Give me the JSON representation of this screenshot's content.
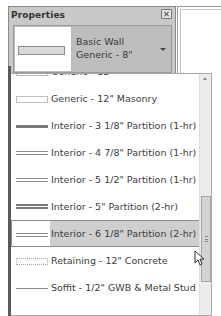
{
  "panel": {
    "title": "Properties",
    "close_icon": "close-icon"
  },
  "type_selector": {
    "family": "Basic Wall",
    "type": "Generic - 8\"",
    "arrow_icon": "dropdown-arrow-icon"
  },
  "dropdown": {
    "items": [
      {
        "label": "Generic - 12\"",
        "swatch": "empty",
        "partial": true
      },
      {
        "label": "Generic - 12\" Masonry",
        "swatch": "empty"
      },
      {
        "label": "Interior - 3 1/8\" Partition (1-hr)",
        "swatch": "thick"
      },
      {
        "label": "Interior - 4 7/8\" Partition (1-hr)",
        "swatch": "double"
      },
      {
        "label": "Interior - 5 1/2\" Partition (1-hr)",
        "swatch": "double"
      },
      {
        "label": "Interior - 5\" Partition (2-hr)",
        "swatch": "double2"
      },
      {
        "label": "Interior - 6 1/8\" Partition (2-hr)",
        "swatch": "double",
        "selected": true
      },
      {
        "label": "Retaining - 12\" Concrete",
        "swatch": "dotted"
      },
      {
        "label": "Soffit - 1/2\" GWB & Metal Stud",
        "swatch": "thin"
      }
    ],
    "selected_index": 6
  },
  "colors": {
    "panel_bg": "#c9c9c9",
    "selected_bg": "#cfcfcf",
    "text": "#3c3c3c"
  }
}
